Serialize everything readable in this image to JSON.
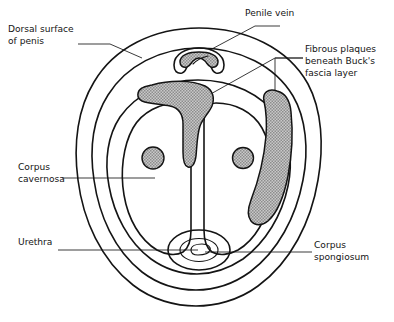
{
  "figure": {
    "type": "anatomical-cross-section",
    "background_color": "#ffffff",
    "line_color": "#141414",
    "shaded_fill_color": "#a8a8a8",
    "leader_line_color": "#303030"
  },
  "labels": {
    "dorsal_surface": {
      "line1": "Dorsal surface",
      "line2": "of penis",
      "align": "left",
      "x": 8,
      "y": 32
    },
    "penile_vein": {
      "line1": "Penile vein",
      "align": "left",
      "x": 245,
      "y": 16
    },
    "fibrous_plaques": {
      "line1": "Fibrous plaques",
      "line2": "beneath Buck's",
      "line3": "fascia layer",
      "align": "left",
      "x": 305,
      "y": 52
    },
    "corpus_cavernosa": {
      "line1": "Corpus",
      "line2": "cavernosa",
      "align": "left",
      "x": 18,
      "y": 170
    },
    "urethra": {
      "line1": "Urethra",
      "align": "left",
      "x": 18,
      "y": 245
    },
    "corpus_spongiosum": {
      "line1": "Corpus",
      "line2": "spongiosum",
      "align": "left",
      "x": 314,
      "y": 248
    }
  },
  "structures": {
    "skin_outline": "outer skin boundary of penile shaft",
    "bucks_fascia": "Buck's fascia layer",
    "tunica_albuginea": "tunica albuginea enclosing corpora",
    "corpus_cavernosum_left": "left corpus cavernosum",
    "corpus_cavernosum_right": "right corpus cavernosum",
    "cavernosal_artery_left": "left cavernosal artery",
    "cavernosal_artery_right": "right cavernosal artery",
    "deep_dorsal_vein": "deep dorsal penile vein",
    "corpus_spongiosum": "corpus spongiosum",
    "urethra_lumen": "urethral lumen",
    "plaque_left": "fibrous plaque at dorsal septum",
    "plaque_right": "fibrous plaque along lateral wall"
  }
}
